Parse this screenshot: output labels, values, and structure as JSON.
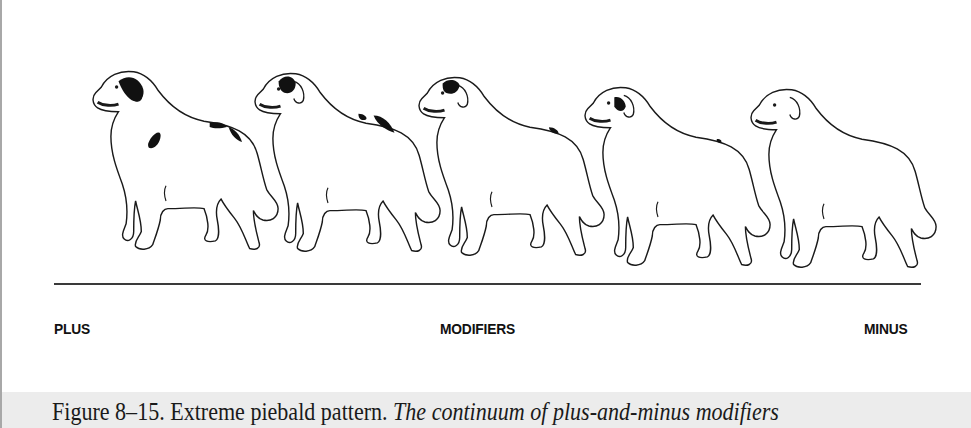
{
  "figure": {
    "dogs": [
      {
        "position": 1,
        "spotting": "most",
        "description": "dog with large head patch and several body spots"
      },
      {
        "position": 2,
        "spotting": "high",
        "description": "dog with head patch and two back spots"
      },
      {
        "position": 3,
        "spotting": "medium",
        "description": "dog with head patch and one back spot"
      },
      {
        "position": 4,
        "spotting": "low",
        "description": "dog with small head patch and tiny back spot"
      },
      {
        "position": 5,
        "spotting": "none",
        "description": "all-white dog"
      }
    ],
    "scale": {
      "left_label": "PLUS",
      "center_label": "MODIFIERS",
      "right_label": "MINUS"
    }
  },
  "caption": {
    "label": "Figure 8–15. Extreme piebald pattern.",
    "italic_text": "The continuum of plus-and-minus modifiers"
  },
  "colors": {
    "caption_background": "#ececec",
    "line": "#3a3a3a",
    "ink": "#111111"
  }
}
